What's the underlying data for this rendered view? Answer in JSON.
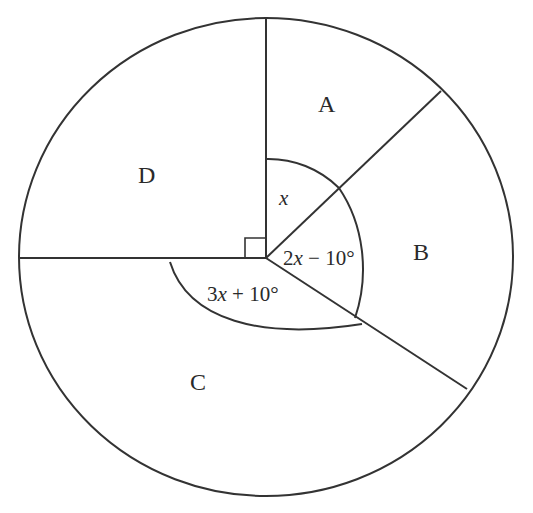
{
  "diagram": {
    "type": "circle-graph-angles",
    "colors": {
      "stroke": "#333333",
      "text": "#2a2a2a",
      "background": "#ffffff"
    },
    "regions": [
      {
        "id": "A",
        "label": "A"
      },
      {
        "id": "B",
        "label": "B"
      },
      {
        "id": "C",
        "label": "C"
      },
      {
        "id": "D",
        "label": "D"
      }
    ],
    "angles": {
      "a": {
        "var": "x",
        "text": ""
      },
      "b": {
        "prefix": "2",
        "var": "x",
        "suffix": " − 10°"
      },
      "c": {
        "prefix": "3",
        "var": "x",
        "suffix": " + 10°"
      },
      "d": {
        "marker": "right-angle"
      }
    }
  }
}
